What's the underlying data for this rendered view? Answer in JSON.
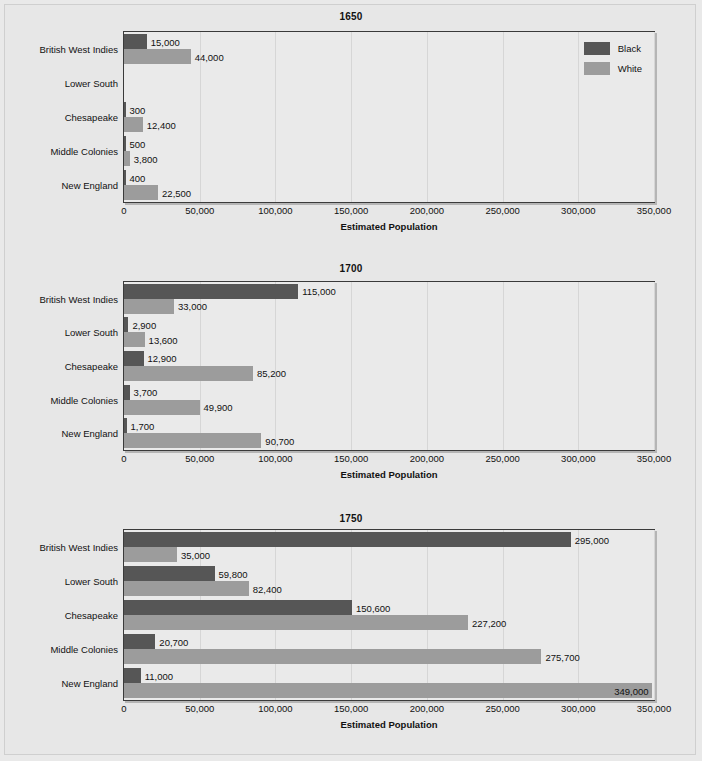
{
  "chart_data": [
    {
      "type": "bar",
      "orientation": "horizontal",
      "title": "1650",
      "xlabel": "Estimated Population",
      "ylabel": "",
      "xlim": [
        0,
        350000
      ],
      "xticks": [
        "0",
        "50,000",
        "100,000",
        "150,000",
        "200,000",
        "250,000",
        "300,000",
        "350,000"
      ],
      "xtick_values": [
        0,
        50000,
        100000,
        150000,
        200000,
        250000,
        300000,
        350000
      ],
      "grid": true,
      "legend": [
        "Black",
        "White"
      ],
      "legend_position": "top-right",
      "categories": [
        "British West Indies",
        "Lower South",
        "Chesapeake",
        "Middle Colonies",
        "New England"
      ],
      "series": [
        {
          "name": "Black",
          "values": [
            15000,
            null,
            300,
            500,
            400
          ],
          "labels": [
            "15,000",
            "",
            "300",
            "500",
            "400"
          ]
        },
        {
          "name": "White",
          "values": [
            44000,
            null,
            12400,
            3800,
            22500
          ],
          "labels": [
            "44,000",
            "",
            "12,400",
            "3,800",
            "22,500"
          ]
        }
      ]
    },
    {
      "type": "bar",
      "orientation": "horizontal",
      "title": "1700",
      "xlabel": "Estimated Population",
      "ylabel": "",
      "xlim": [
        0,
        350000
      ],
      "xticks": [
        "0",
        "50,000",
        "100,000",
        "150,000",
        "200,000",
        "250,000",
        "300,000",
        "350,000"
      ],
      "xtick_values": [
        0,
        50000,
        100000,
        150000,
        200000,
        250000,
        300000,
        350000
      ],
      "grid": true,
      "legend": [],
      "categories": [
        "British West Indies",
        "Lower South",
        "Chesapeake",
        "Middle Colonies",
        "New England"
      ],
      "series": [
        {
          "name": "Black",
          "values": [
            115000,
            2900,
            12900,
            3700,
            1700
          ],
          "labels": [
            "115,000",
            "2,900",
            "12,900",
            "3,700",
            "1,700"
          ]
        },
        {
          "name": "White",
          "values": [
            33000,
            13600,
            85200,
            49900,
            90700
          ],
          "labels": [
            "33,000",
            "13,600",
            "85,200",
            "49,900",
            "90,700"
          ]
        }
      ]
    },
    {
      "type": "bar",
      "orientation": "horizontal",
      "title": "1750",
      "xlabel": "Estimated Population",
      "ylabel": "",
      "xlim": [
        0,
        350000
      ],
      "xticks": [
        "0",
        "50,000",
        "100,000",
        "150,000",
        "200,000",
        "250,000",
        "300,000",
        "350,000"
      ],
      "xtick_values": [
        0,
        50000,
        100000,
        150000,
        200000,
        250000,
        300000,
        350000
      ],
      "grid": true,
      "legend": [],
      "categories": [
        "British West Indies",
        "Lower South",
        "Chesapeake",
        "Middle Colonies",
        "New England"
      ],
      "series": [
        {
          "name": "Black",
          "values": [
            295000,
            59800,
            150600,
            20700,
            11000
          ],
          "labels": [
            "295,000",
            "59,800",
            "150,600",
            "20,700",
            "11,000"
          ]
        },
        {
          "name": "White",
          "values": [
            35000,
            82400,
            227200,
            275700,
            349000
          ],
          "labels": [
            "35,000",
            "82,400",
            "227,200",
            "275,700",
            "349,000"
          ]
        }
      ]
    }
  ],
  "colors": {
    "black_series": "#565656",
    "white_series": "#9c9c9c",
    "background": "#e7e7e7",
    "axis": "#3a3a3a",
    "gridline": "#d6d6d6"
  }
}
